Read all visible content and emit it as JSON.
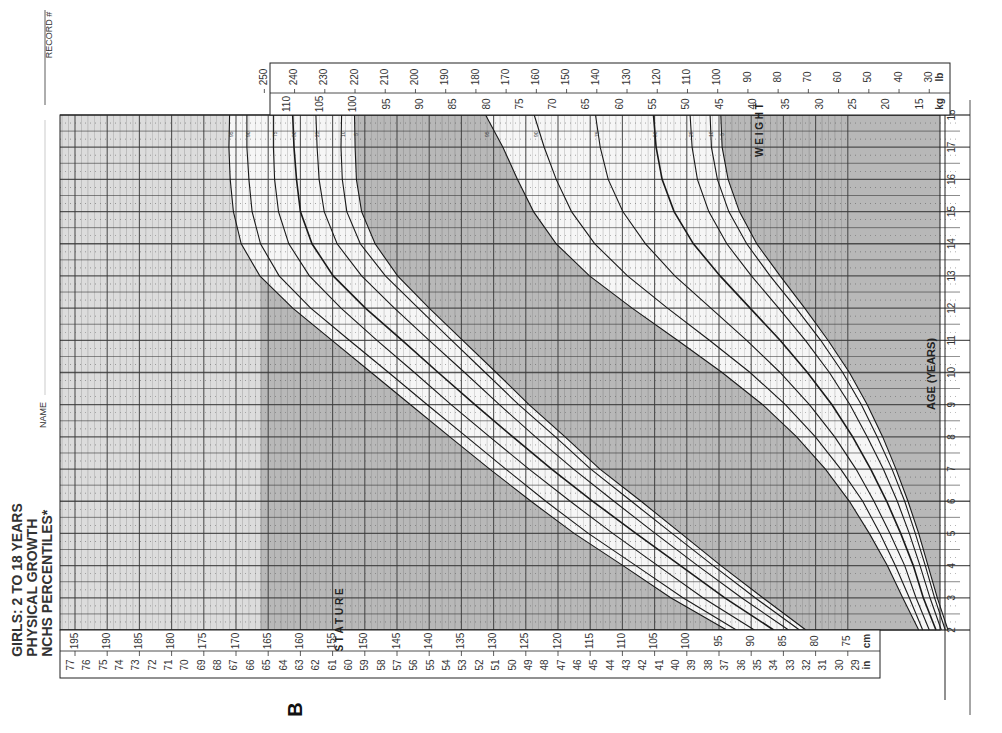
{
  "title": {
    "line1": "GIRLS: 2 TO 18 YEARS",
    "line2": "PHYSICAL GROWTH",
    "line3": "NCHS PERCENTILES*"
  },
  "form_fields": {
    "name_label": "NAME",
    "record_label": "RECORD #"
  },
  "figure_letter": "B",
  "labels": {
    "stature": "STATURE",
    "weight": "WEIGHT",
    "age_axis": "AGE (YEARS)",
    "unit_in": "in",
    "unit_cm": "cm",
    "unit_kg": "kg",
    "unit_lb": "lb"
  },
  "chart_data": {
    "type": "line",
    "title": "GIRLS: 2 TO 18 YEARS PHYSICAL GROWTH NCHS PERCENTILES*",
    "orientation": "rotated 90° (age runs bottom-to-top on right edge)",
    "xlabel": "AGE (YEARS)",
    "x": [
      2,
      3,
      4,
      5,
      6,
      7,
      8,
      9,
      10,
      11,
      12,
      13,
      14,
      15,
      16,
      17,
      18
    ],
    "age_ticks": [
      2,
      3,
      4,
      5,
      6,
      7,
      8,
      9,
      10,
      11,
      12,
      13,
      14,
      15,
      16,
      17,
      18
    ],
    "stature_axis": {
      "label": "STATURE",
      "cm_ticks": [
        195,
        190,
        185,
        180,
        175,
        170,
        165,
        160,
        155,
        150,
        145,
        140,
        135,
        130,
        125,
        120,
        115,
        110,
        105,
        100,
        95,
        90,
        85,
        80,
        75
      ],
      "in_ticks": [
        77,
        76,
        75,
        74,
        73,
        72,
        71,
        70,
        69,
        68,
        67,
        66,
        65,
        64,
        63,
        62,
        61,
        60,
        59,
        58,
        57,
        56,
        55,
        54,
        53,
        52,
        51,
        50,
        49,
        48,
        47,
        46,
        45,
        44,
        43,
        42,
        41,
        40,
        39,
        38,
        37,
        36,
        35,
        34,
        33,
        32,
        31,
        30,
        29
      ],
      "range_cm": [
        75,
        197
      ]
    },
    "weight_axis": {
      "label": "WEIGHT",
      "kg_ticks": [
        110,
        105,
        100,
        95,
        90,
        85,
        80,
        75,
        70,
        65,
        60,
        55,
        50,
        45,
        40,
        35,
        30,
        25,
        20,
        15
      ],
      "lb_ticks": [
        250,
        240,
        230,
        220,
        210,
        200,
        190,
        180,
        170,
        160,
        150,
        140,
        130,
        120,
        110,
        100,
        90,
        80,
        70,
        60,
        50,
        40,
        30
      ],
      "range_kg": [
        10,
        112
      ]
    },
    "percentiles": [
      "95",
      "90",
      "75",
      "50",
      "25",
      "10",
      "5"
    ],
    "stature_series": [
      {
        "name": "95",
        "values": [
          93.8,
          102.5,
          109.9,
          117.5,
          124.2,
          130.6,
          136.8,
          142.9,
          149.0,
          155.1,
          161.2,
          166.3,
          169.2,
          170.4,
          170.9,
          171.1,
          171.0
        ]
      },
      {
        "name": "90",
        "values": [
          92.3,
          100.6,
          107.9,
          115.3,
          121.9,
          128.1,
          134.2,
          140.3,
          146.3,
          152.4,
          158.4,
          163.3,
          166.2,
          167.5,
          168.0,
          168.3,
          168.3
        ]
      },
      {
        "name": "75",
        "values": [
          89.5,
          97.5,
          104.5,
          111.5,
          118.1,
          124.5,
          130.6,
          136.6,
          142.3,
          148.1,
          153.7,
          158.6,
          161.8,
          163.4,
          164.0,
          164.2,
          164.2
        ]
      },
      {
        "name": "50",
        "values": [
          86.5,
          94.1,
          101.0,
          107.9,
          114.6,
          121.0,
          127.0,
          132.9,
          138.6,
          144.2,
          149.9,
          154.9,
          158.2,
          160.0,
          160.6,
          161.0,
          161.2
        ]
      },
      {
        "name": "25",
        "values": [
          84.2,
          91.5,
          98.3,
          104.9,
          111.3,
          117.6,
          123.5,
          129.1,
          134.5,
          140.0,
          145.4,
          150.5,
          154.3,
          156.3,
          157.1,
          157.4,
          157.6
        ]
      },
      {
        "name": "10",
        "values": [
          82.5,
          89.4,
          95.9,
          102.3,
          108.6,
          114.9,
          120.4,
          126.1,
          131.3,
          136.5,
          141.7,
          146.8,
          150.7,
          152.8,
          153.5,
          153.7,
          153.6
        ]
      },
      {
        "name": "5",
        "values": [
          81.5,
          88.2,
          94.7,
          100.9,
          107.1,
          113.5,
          118.9,
          124.5,
          129.6,
          134.8,
          140.0,
          144.9,
          148.4,
          150.5,
          151.3,
          151.5,
          151.6
        ]
      }
    ],
    "weight_series": [
      {
        "name": "95",
        "values": [
          15.2,
          17.6,
          19.9,
          22.6,
          25.6,
          29.2,
          33.5,
          38.6,
          44.7,
          51.4,
          58.2,
          64.6,
          69.6,
          73.0,
          75.4,
          77.6,
          80.2
        ]
      },
      {
        "name": "90",
        "values": [
          14.6,
          16.6,
          18.7,
          21.0,
          23.6,
          26.9,
          30.7,
          35.2,
          40.5,
          46.6,
          52.9,
          58.9,
          63.8,
          67.3,
          69.6,
          71.4,
          72.9
        ]
      },
      {
        "name": "75",
        "values": [
          13.6,
          15.6,
          17.3,
          19.5,
          21.9,
          24.6,
          27.8,
          31.6,
          36.0,
          41.0,
          46.4,
          51.8,
          56.2,
          59.6,
          61.8,
          63.0,
          63.7
        ]
      },
      {
        "name": "50",
        "values": [
          12.6,
          14.5,
          16.0,
          17.9,
          20.0,
          22.4,
          25.1,
          28.2,
          31.9,
          36.0,
          40.5,
          45.0,
          49.0,
          51.9,
          53.7,
          54.6,
          55.0
        ]
      },
      {
        "name": "25",
        "values": [
          11.8,
          13.5,
          15.0,
          16.6,
          18.4,
          20.5,
          22.9,
          25.5,
          28.6,
          32.2,
          36.2,
          40.3,
          44.0,
          46.7,
          48.4,
          49.2,
          49.5
        ]
      },
      {
        "name": "10",
        "values": [
          11.2,
          12.8,
          14.2,
          15.7,
          17.3,
          19.2,
          21.4,
          23.8,
          26.6,
          29.9,
          33.6,
          37.5,
          41.0,
          43.7,
          45.4,
          46.3,
          46.5
        ]
      },
      {
        "name": "5",
        "values": [
          10.8,
          12.4,
          13.8,
          15.2,
          16.8,
          18.6,
          20.6,
          22.9,
          25.6,
          28.8,
          32.3,
          36.0,
          39.5,
          42.1,
          43.8,
          44.7,
          44.9
        ]
      }
    ],
    "grid": true,
    "legend": "percentile labels (95, 90, 75, 50, 25, 10, 5) at end of each curve near age 17.5"
  },
  "colors": {
    "paper": "#ffffff",
    "shade_dark": "#b8b8b8",
    "shade_light": "#dcdcdc",
    "band_white": "#f6f6f6",
    "grid": "#3a3a3a",
    "curve": "#1a1a1a"
  }
}
